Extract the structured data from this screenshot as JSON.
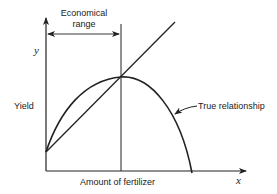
{
  "diagram": {
    "labels": {
      "economical_range_line1": "Economical",
      "economical_range_line2": "range",
      "y_axis": "y",
      "x_axis": "x",
      "yield": "Yield",
      "x_title": "Amount of fertilizer",
      "true_relationship": "True relationship"
    },
    "colors": {
      "ink": "#222222",
      "background": "#ffffff"
    }
  }
}
